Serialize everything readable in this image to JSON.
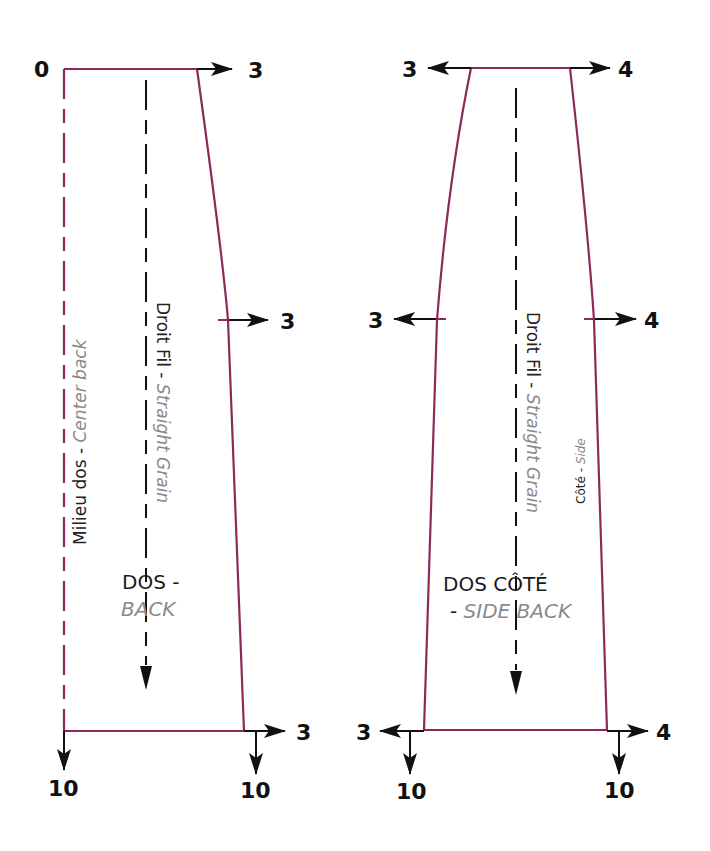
{
  "colors": {
    "pattern_line": "#8b2a5a",
    "arrow": "#111111",
    "label_dark": "#222222",
    "label_grey": "#8a8a8a",
    "background": "#ffffff"
  },
  "back_piece": {
    "title_fr": "DOS -",
    "title_en": "BACK",
    "center_back_fr": "Milieu dos",
    "center_back_sep": " - ",
    "center_back_en": "Center back",
    "grain_fr": "Droit Fil",
    "grain_sep": " - ",
    "grain_en": "Straight Grain",
    "top_left_value": "0",
    "top_right_value": "3",
    "waist_right_value": "3",
    "hem_right_value": "3",
    "hem_left_down_value": "10",
    "hem_right_down_value": "10"
  },
  "side_back_piece": {
    "title_fr": "DOS CÔTÉ",
    "title_en_prefix": "- ",
    "title_en": "SIDE BACK",
    "side_fr": "Côté",
    "side_sep": " - ",
    "side_en": "Side",
    "grain_fr": "Droit Fil",
    "grain_sep": " - ",
    "grain_en": "Straight Grain",
    "top_left_value": "3",
    "top_right_value": "4",
    "waist_left_value": "3",
    "waist_right_value": "4",
    "hem_left_value": "3",
    "hem_right_value": "4",
    "hem_left_down_value": "10",
    "hem_right_down_value": "10"
  }
}
